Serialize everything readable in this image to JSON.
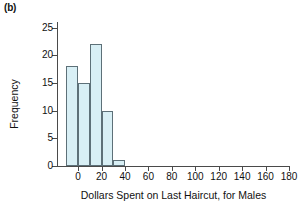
{
  "panel": {
    "label": "(b)"
  },
  "chart_data": {
    "type": "bar",
    "title": "",
    "xlabel": "Dollars Spent on Last Haircut, for Males",
    "ylabel": "Frequency",
    "xlim": [
      -18,
      180
    ],
    "ylim": [
      0,
      26
    ],
    "grid": false,
    "legend": null,
    "bin_width": 10,
    "bin_edges": [
      -10,
      0,
      10,
      20,
      30,
      40
    ],
    "categories": [
      "-10 to 0",
      "0 to 10",
      "10 to 20",
      "20 to 30",
      "30 to 40"
    ],
    "values": [
      18,
      15,
      22,
      10,
      1
    ],
    "bars": [
      {
        "x0": -10,
        "x1": 0,
        "value": 18
      },
      {
        "x0": 0,
        "x1": 10,
        "value": 15
      },
      {
        "x0": 10,
        "x1": 20,
        "value": 22
      },
      {
        "x0": 20,
        "x1": 30,
        "value": 10
      },
      {
        "x0": 30,
        "x1": 40,
        "value": 1
      }
    ],
    "xticks": [
      0,
      20,
      40,
      60,
      80,
      100,
      120,
      140,
      160,
      180
    ],
    "xtick_labels": [
      "0",
      "20",
      "40",
      "60",
      "80",
      "100",
      "120",
      "140",
      "160",
      "180"
    ],
    "yticks": [
      0,
      5,
      10,
      15,
      20,
      25
    ],
    "ytick_labels": [
      "0",
      "5",
      "10",
      "15",
      "20",
      "25"
    ],
    "bar_fill_color": "#d8eff5",
    "bar_edge_color": "#5d7078",
    "axis_color": "#4a4a4a",
    "background_color": "#ffffff"
  }
}
